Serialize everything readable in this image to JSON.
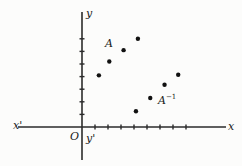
{
  "chart_data": {
    "type": "scatter",
    "title": "",
    "xlabel": "x",
    "ylabel": "y",
    "grid": false,
    "legend": null,
    "axis_labels": {
      "x_positive": "x",
      "x_negative": "x'",
      "y_positive": "y",
      "y_negative": "y'",
      "origin": "O"
    },
    "xlim": [
      -3,
      12
    ],
    "ylim": [
      -2,
      9
    ],
    "x_ticks": [
      1,
      2,
      3,
      4,
      5,
      6,
      7,
      8
    ],
    "y_ticks": [
      1,
      2,
      3,
      4,
      5,
      6,
      7
    ],
    "series": [
      {
        "name": "A",
        "label": "A",
        "label_text": "A",
        "label_sup": "",
        "label_x": 2.05,
        "label_y": 6.15,
        "points": [
          {
            "x": 1.3,
            "y": 4.1
          },
          {
            "x": 2.1,
            "y": 5.2
          },
          {
            "x": 3.2,
            "y": 6.1
          },
          {
            "x": 4.3,
            "y": 7.0
          }
        ]
      },
      {
        "name": "A-inverse",
        "label": "A⁻¹",
        "label_text": "A",
        "label_sup": "−1",
        "label_x": 6.55,
        "label_y": 2.1,
        "points": [
          {
            "x": 4.15,
            "y": 1.25
          },
          {
            "x": 5.25,
            "y": 2.3
          },
          {
            "x": 6.35,
            "y": 3.35
          },
          {
            "x": 7.4,
            "y": 4.15
          }
        ]
      }
    ],
    "colors": {
      "axis": "#2b2b2b",
      "point": "#111111",
      "text": "#1a1a1a",
      "background": "#fcfcfb"
    }
  },
  "geometry": {
    "origin_px": {
      "x": 82,
      "y": 127
    },
    "unit_px": {
      "x": 13.0,
      "y": 12.6
    },
    "point_radius_px": 2.2,
    "tick_len_px": 5,
    "x_axis": {
      "x1": 18,
      "x2": 226,
      "y": 127
    },
    "y_axis": {
      "x": 82,
      "y1": 12,
      "y2": 160
    },
    "labels_px": {
      "x_positive": {
        "x": 228,
        "y": 121
      },
      "x_negative": {
        "x": 13,
        "y": 120
      },
      "y_positive": {
        "x": 86,
        "y": 8
      },
      "y_negative": {
        "x": 86,
        "y": 133
      },
      "origin": {
        "x": 70,
        "y": 131
      },
      "A": {
        "x": 105,
        "y": 38
      },
      "A_inverse": {
        "x": 158,
        "y": 95
      }
    }
  }
}
